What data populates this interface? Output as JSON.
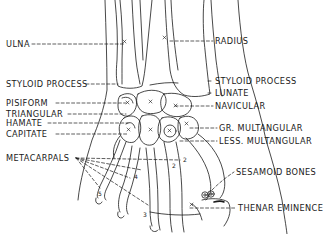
{
  "figure": {
    "ink_color": "#1a1a1a",
    "background_color": "#ffffff"
  },
  "labels_left": [
    {
      "id": "ulna",
      "text": "ULNA",
      "x": 6,
      "y": 40
    },
    {
      "id": "styloid-process-ulna",
      "text": "STYLOID PROCESS",
      "x": 6,
      "y": 80
    },
    {
      "id": "pisiform",
      "text": "PISIFORM",
      "x": 6,
      "y": 99
    },
    {
      "id": "triangular",
      "text": "TRIANGULAR",
      "x": 6,
      "y": 110
    },
    {
      "id": "hamate",
      "text": "HAMATE",
      "x": 6,
      "y": 119
    },
    {
      "id": "capitate",
      "text": "CAPITATE",
      "x": 6,
      "y": 130
    },
    {
      "id": "metacarpals",
      "text": "METACARPALS",
      "x": 6,
      "y": 155
    }
  ],
  "labels_right": [
    {
      "id": "radius",
      "text": "RADIUS",
      "x": 215,
      "y": 37
    },
    {
      "id": "styloid-process-radius",
      "text": "STYLOID PROCESS",
      "x": 215,
      "y": 77
    },
    {
      "id": "lunate",
      "text": "LUNATE",
      "x": 215,
      "y": 89
    },
    {
      "id": "navicular",
      "text": "NAVICULAR",
      "x": 215,
      "y": 102
    },
    {
      "id": "gr-multangular",
      "text": "GR. MULTANGULAR",
      "x": 219,
      "y": 124
    },
    {
      "id": "less-multangular",
      "text": "LESS. MULTANGULAR",
      "x": 219,
      "y": 137
    },
    {
      "id": "sesamoid-bones",
      "text": "SESAMOID BONES",
      "x": 236,
      "y": 168
    },
    {
      "id": "thenar-eminence",
      "text": "THENAR EMINENCE",
      "x": 238,
      "y": 204
    }
  ],
  "bone_marks": {
    "x_mark": "x",
    "metacarpal_numbers": [
      "1",
      "2",
      "3",
      "4",
      "5"
    ]
  }
}
